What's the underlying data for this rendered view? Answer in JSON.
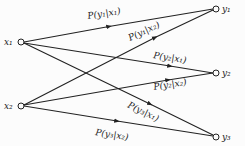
{
  "diagram": {
    "type": "channel transition diagram",
    "inputs": [
      {
        "id": "x1",
        "label": "x₁"
      },
      {
        "id": "x2",
        "label": "x₂"
      }
    ],
    "outputs": [
      {
        "id": "y1",
        "label": "y₁"
      },
      {
        "id": "y2",
        "label": "y₂"
      },
      {
        "id": "y3",
        "label": "y₃"
      }
    ],
    "edges": [
      {
        "from": "x1",
        "to": "y1",
        "label": "P(y₁|x₁)"
      },
      {
        "from": "x2",
        "to": "y1",
        "label": "P(y₁|x₂)"
      },
      {
        "from": "x1",
        "to": "y2",
        "label": "P(y₂|x₁)"
      },
      {
        "from": "x2",
        "to": "y2",
        "label": "P(y₂|x₂)"
      },
      {
        "from": "x1",
        "to": "y3",
        "label": "P(y₃|x₁)"
      },
      {
        "from": "x2",
        "to": "y3",
        "label": "P(y₃|x₂)"
      }
    ]
  }
}
